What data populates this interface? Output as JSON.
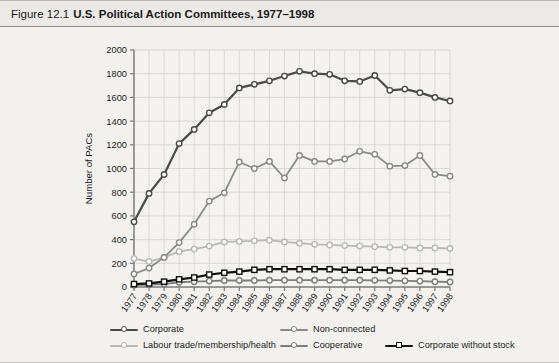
{
  "header": {
    "figure_number": "Figure 12.1",
    "figure_title": "U.S. Political Action Committees, 1977–1998"
  },
  "chart_data": {
    "type": "line",
    "title": "U.S. Political Action Committees, 1977–1998",
    "xlabel": "",
    "ylabel": "Number of PACs",
    "ylim": [
      0,
      2000
    ],
    "ytick_step": 200,
    "yticks": [
      0,
      200,
      400,
      600,
      800,
      1000,
      1200,
      1400,
      1600,
      1800,
      2000
    ],
    "grid": true,
    "legend_position": "bottom",
    "categories": [
      "1977",
      "1978",
      "1979",
      "1980",
      "1981",
      "1982",
      "1983",
      "1984",
      "1985",
      "1986",
      "1987",
      "1988",
      "1989",
      "1990",
      "1991",
      "1992",
      "1993",
      "1994",
      "1995",
      "1996",
      "1997",
      "1998"
    ],
    "series": [
      {
        "name": "Corporate",
        "color": "#4a4a4a",
        "marker": "circle",
        "values": [
          550,
          790,
          950,
          1210,
          1330,
          1470,
          1540,
          1680,
          1710,
          1740,
          1780,
          1820,
          1800,
          1795,
          1740,
          1735,
          1785,
          1660,
          1670,
          1640,
          1600,
          1570
        ]
      },
      {
        "name": "Labour trade/membership/health",
        "color": "#b8b8b8",
        "marker": "circle",
        "values": [
          240,
          215,
          250,
          300,
          320,
          345,
          380,
          385,
          390,
          395,
          380,
          370,
          360,
          355,
          350,
          345,
          340,
          335,
          335,
          330,
          330,
          325
        ]
      },
      {
        "name": "Non-connected",
        "color": "#8a8a8a",
        "marker": "circle",
        "values": [
          110,
          160,
          250,
          375,
          530,
          725,
          795,
          1055,
          1000,
          1060,
          920,
          1110,
          1060,
          1060,
          1080,
          1145,
          1120,
          1020,
          1025,
          1110,
          950,
          935
        ]
      },
      {
        "name": "Cooperative",
        "color": "#7d7d7d",
        "marker": "circle",
        "values": [
          15,
          20,
          25,
          40,
          45,
          50,
          55,
          55,
          55,
          58,
          58,
          58,
          58,
          58,
          58,
          58,
          56,
          54,
          52,
          50,
          45,
          42
        ]
      },
      {
        "name": "Corporate without stock",
        "color": "#111111",
        "marker": "square",
        "values": [
          25,
          30,
          45,
          65,
          80,
          105,
          120,
          130,
          145,
          150,
          150,
          150,
          150,
          150,
          145,
          145,
          145,
          140,
          135,
          135,
          130,
          125
        ]
      }
    ]
  },
  "legend": {
    "items": [
      {
        "label": "Corporate"
      },
      {
        "label": "Labour trade/membership/health"
      },
      {
        "label": "Non-connected"
      },
      {
        "label": "Cooperative"
      },
      {
        "label": "Corporate without stock"
      }
    ]
  }
}
